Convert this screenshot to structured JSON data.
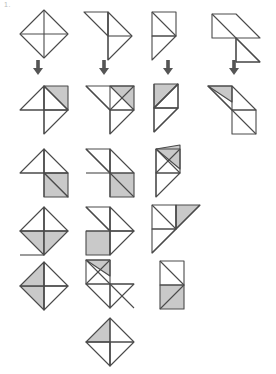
{
  "page": {
    "corner_label": "1.",
    "width": 276,
    "height": 374,
    "background": "#ffffff",
    "stroke_color": "#4a4a4a",
    "shade_color": "#c9c9c9",
    "arrow_color": "#555555"
  },
  "arrows": {
    "glyph": "arrow-down",
    "count": 4,
    "label": "transforms-into",
    "x_positions": [
      38,
      104,
      168,
      234
    ],
    "y": 62
  },
  "rows": [
    {
      "id": "row-source",
      "label": "Source figures",
      "y": 8,
      "figures": [
        {
          "id": "r1c1",
          "name": "diamond-with-cross-and-tail",
          "x": 14,
          "shaded": false
        },
        {
          "id": "r1c2",
          "name": "flag-triangle-pair",
          "x": 80,
          "shaded": false
        },
        {
          "id": "r1c3",
          "name": "narrow-square-with-fin",
          "x": 148,
          "shaded": false
        },
        {
          "id": "r1c4",
          "name": "long-slanted-parallel-band",
          "x": 206,
          "shaded": false
        }
      ]
    },
    {
      "id": "row-result",
      "label": "Transformed figures",
      "y": 80,
      "figures": [
        {
          "id": "r2c1",
          "name": "diamond-with-shaded-upper-right",
          "x": 14,
          "shaded": true
        },
        {
          "id": "r2c2",
          "name": "flag-with-shaded-upper-right",
          "x": 80,
          "shaded": true
        },
        {
          "id": "r2c3",
          "name": "fin-with-shaded-top",
          "x": 148,
          "shaded": true
        },
        {
          "id": "r2c4",
          "name": "band-with-shaded-top-left",
          "x": 204,
          "shaded": true
        }
      ]
    },
    {
      "id": "row-3",
      "label": "Variant row 3",
      "y": 145,
      "figures": [
        {
          "id": "r3c1",
          "name": "diamond-with-shaded-lower-right",
          "x": 14,
          "shaded": true
        },
        {
          "id": "r3c2",
          "name": "flag-with-shaded-lower-right",
          "x": 80,
          "shaded": true
        },
        {
          "id": "r3c3",
          "name": "fin-with-shaded-upper-corner",
          "x": 148,
          "shaded": true
        }
      ]
    },
    {
      "id": "row-4",
      "label": "Variant row 4",
      "y": 203,
      "figures": [
        {
          "id": "r4c1",
          "name": "diamond-with-shaded-bottom",
          "x": 14,
          "shaded": true
        },
        {
          "id": "r4c2",
          "name": "flag-with-shaded-bottom-left",
          "x": 80,
          "shaded": true
        },
        {
          "id": "r4c3",
          "name": "fin-with-shaded-right-wedge",
          "x": 146,
          "shaded": true
        }
      ]
    },
    {
      "id": "row-5",
      "label": "Variant row 5",
      "y": 258,
      "figures": [
        {
          "id": "r5c1",
          "name": "diamond-with-shaded-left",
          "x": 14,
          "shaded": true
        },
        {
          "id": "r5c2",
          "name": "zigzag-with-shaded-top",
          "x": 78,
          "shaded": true
        },
        {
          "id": "r5c3",
          "name": "tall-rectangle-with-shaded-lower",
          "x": 154,
          "shaded": true
        }
      ]
    },
    {
      "id": "row-6",
      "label": "Variant row 6",
      "y": 316,
      "figures": [
        {
          "id": "r6c1",
          "name": "zigzag-with-shaded-upper-left",
          "x": 78,
          "shaded": true
        }
      ]
    }
  ]
}
